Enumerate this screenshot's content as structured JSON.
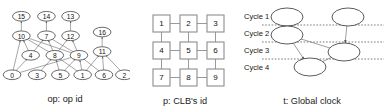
{
  "figure": {
    "panels": [
      {
        "id": "op-graph",
        "caption": "op: op id",
        "type": "dag",
        "nodes": [
          {
            "id": "15",
            "label": "15",
            "cx": 23,
            "cy": 14
          },
          {
            "id": "14",
            "label": "14",
            "cx": 50,
            "cy": 14
          },
          {
            "id": "13",
            "label": "13",
            "cx": 76,
            "cy": 14
          },
          {
            "id": "10",
            "label": "10",
            "cx": 23,
            "cy": 35
          },
          {
            "id": "7",
            "label": "7",
            "cx": 50,
            "cy": 35
          },
          {
            "id": "12",
            "label": "12",
            "cx": 76,
            "cy": 35
          },
          {
            "id": "16",
            "label": "16",
            "cx": 110,
            "cy": 31
          },
          {
            "id": "4",
            "label": "4",
            "cx": 33,
            "cy": 56
          },
          {
            "id": "8",
            "label": "8",
            "cx": 59,
            "cy": 56
          },
          {
            "id": "9",
            "label": "9",
            "cx": 85,
            "cy": 56
          },
          {
            "id": "11",
            "label": "11",
            "cx": 110,
            "cy": 52
          },
          {
            "id": "0",
            "label": "0",
            "cx": 13,
            "cy": 77
          },
          {
            "id": "3",
            "label": "3",
            "cx": 40,
            "cy": 77
          },
          {
            "id": "5",
            "label": "5",
            "cx": 65,
            "cy": 77
          },
          {
            "id": "1",
            "label": "1",
            "cx": 89,
            "cy": 77
          },
          {
            "id": "6",
            "label": "6",
            "cx": 112,
            "cy": 77
          },
          {
            "id": "2",
            "label": "2",
            "cx": 134,
            "cy": 77
          }
        ],
        "edges": [
          {
            "from": "10",
            "to": "15"
          },
          {
            "from": "7",
            "to": "14"
          },
          {
            "from": "12",
            "to": "13"
          },
          {
            "from": "4",
            "to": "10"
          },
          {
            "from": "8",
            "to": "10"
          },
          {
            "from": "9",
            "to": "10"
          },
          {
            "from": "4",
            "to": "7"
          },
          {
            "from": "8",
            "to": "7"
          },
          {
            "from": "9",
            "to": "7"
          },
          {
            "from": "8",
            "to": "12"
          },
          {
            "from": "9",
            "to": "12"
          },
          {
            "from": "0",
            "to": "10"
          },
          {
            "from": "0",
            "to": "4"
          },
          {
            "from": "3",
            "to": "8"
          },
          {
            "from": "5",
            "to": "8"
          },
          {
            "from": "1",
            "to": "8"
          },
          {
            "from": "5",
            "to": "9"
          },
          {
            "from": "1",
            "to": "9"
          },
          {
            "from": "6",
            "to": "9"
          },
          {
            "from": "0",
            "to": "9"
          },
          {
            "from": "11",
            "to": "16"
          },
          {
            "from": "1",
            "to": "11"
          },
          {
            "from": "6",
            "to": "11"
          },
          {
            "from": "2",
            "to": "11"
          }
        ]
      },
      {
        "id": "clb-grid",
        "caption": "p: CLB's id",
        "type": "grid",
        "rows": 3,
        "cols": 3,
        "cells": [
          {
            "label": "1",
            "row": 0,
            "col": 0
          },
          {
            "label": "2",
            "row": 0,
            "col": 1
          },
          {
            "label": "3",
            "row": 0,
            "col": 2
          },
          {
            "label": "4",
            "row": 1,
            "col": 0
          },
          {
            "label": "5",
            "row": 1,
            "col": 1
          },
          {
            "label": "6",
            "row": 1,
            "col": 2
          },
          {
            "label": "7",
            "row": 2,
            "col": 0
          },
          {
            "label": "8",
            "row": 2,
            "col": 1
          },
          {
            "label": "9",
            "row": 2,
            "col": 2
          }
        ]
      },
      {
        "id": "global-clock",
        "caption": "t: Global clock",
        "type": "schedule",
        "cycle_labels": [
          "Cycle 1",
          "Cycle 2",
          "Cycle 3",
          "Cycle 4"
        ],
        "nodes": [
          {
            "id": "n1",
            "cx": 47,
            "cy": 17,
            "rx": 16,
            "ry": 9
          },
          {
            "id": "n2",
            "cx": 47,
            "cy": 35,
            "rx": 16,
            "ry": 9
          },
          {
            "id": "n3",
            "cx": 108,
            "cy": 17,
            "rx": 16,
            "ry": 9
          },
          {
            "id": "n4",
            "cx": 104,
            "cy": 52,
            "rx": 16,
            "ry": 9
          },
          {
            "id": "n5",
            "cx": 70,
            "cy": 67,
            "rx": 16,
            "ry": 9
          }
        ],
        "edges": [
          {
            "from": "n1",
            "to": "n2"
          },
          {
            "from": "n3",
            "to": "n4"
          },
          {
            "from": "n2",
            "to": "n4"
          },
          {
            "from": "n2",
            "to": "n5"
          },
          {
            "from": "n4",
            "to": "n5"
          }
        ]
      }
    ]
  },
  "colors": {
    "node_stroke": "#4a4a4a",
    "edge": "#6b6b6b",
    "grid_stroke": "#9a9a9a",
    "background": "#ffffff",
    "text": "#111111"
  }
}
